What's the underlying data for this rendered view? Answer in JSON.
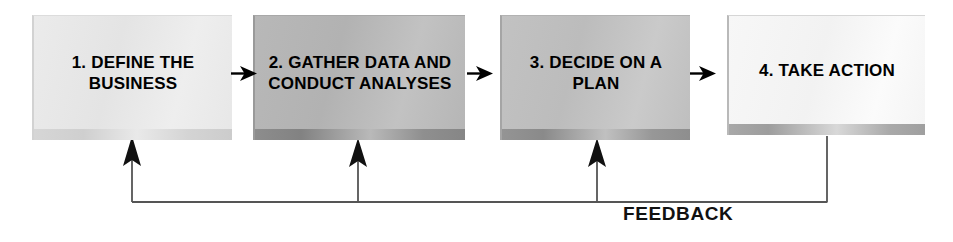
{
  "diagram": {
    "type": "linear-process-flow-with-feedback",
    "background_color": "#ffffff",
    "boxes": [
      {
        "id": "box-1",
        "number": "1.",
        "label": "1. DEFINE THE BUSINESS",
        "fill_color": "#e8e8e8",
        "shadow_color": "#d4d4d4"
      },
      {
        "id": "box-2",
        "number": "2.",
        "label": "2. GATHER DATA AND CONDUCT ANALYSES",
        "fill_color": "#b8b8b8",
        "shadow_color": "#888888"
      },
      {
        "id": "box-3",
        "number": "3.",
        "label": "3. DECIDE ON A PLAN",
        "fill_color": "#c0c0c0",
        "shadow_color": "#919191"
      },
      {
        "id": "box-4",
        "number": "4.",
        "label": "4. TAKE ACTION",
        "fill_color": "#f6f6f6",
        "shadow_color": "#a6a6a6"
      }
    ],
    "connectors": [
      {
        "id": "arrow-1-2",
        "from": "box-1",
        "to": "box-2",
        "direction": "right"
      },
      {
        "id": "arrow-2-3",
        "from": "box-2",
        "to": "box-3",
        "direction": "right"
      },
      {
        "id": "arrow-3-4",
        "from": "box-3",
        "to": "box-4",
        "direction": "right"
      }
    ],
    "feedback": {
      "label": "FEEDBACK",
      "line_color": "#555555",
      "from": "box-4",
      "to": [
        "box-1",
        "box-2",
        "box-3"
      ],
      "direction": "up"
    }
  }
}
